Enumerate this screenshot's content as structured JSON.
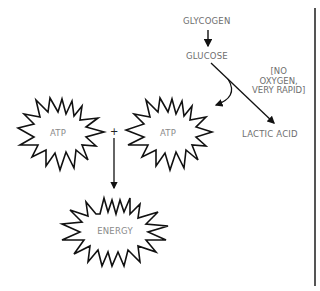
{
  "diagram": {
    "nodes": {
      "glycogen": "GLYCOGEN",
      "glucose": "GLUCOSE",
      "lactic_acid": "LACTIC ACID",
      "atp_left": "ATP",
      "atp_right": "ATP",
      "energy": "ENERGY"
    },
    "plus_sign": "+",
    "condition_note": {
      "line1": "[NO",
      "line2": "OXYGEN,",
      "line3": "VERY RAPID]"
    },
    "edges": [
      {
        "from": "GLYCOGEN",
        "to": "GLUCOSE"
      },
      {
        "from": "GLUCOSE",
        "to": "LACTIC ACID",
        "label": "[NO OXYGEN, VERY RAPID]"
      },
      {
        "from": "GLUCOSE",
        "to": "ATP"
      },
      {
        "from": "ATP + ATP",
        "to": "ENERGY"
      }
    ],
    "colors": {
      "text": "#6e6e6e",
      "stroke": "#111111",
      "background": "#ffffff"
    }
  }
}
